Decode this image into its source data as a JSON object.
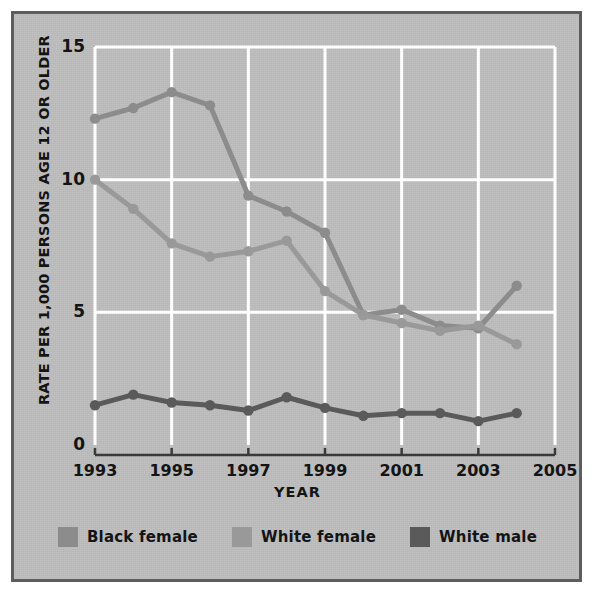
{
  "figure": {
    "background_color": "#bdbdbd",
    "border_color": "#5d5d5d",
    "gridline_color": "#ffffff",
    "axis_color": "#3a3a3a"
  },
  "axes": {
    "ylabel": "RATE PER 1,000 PERSONS AGE 12 OR OLDER",
    "xlabel": "YEAR",
    "yticks": [
      "0",
      "5",
      "10",
      "15"
    ],
    "xticks": [
      "1993",
      "1995",
      "1997",
      "1999",
      "2001",
      "2003",
      "2005"
    ]
  },
  "legend": {
    "items": [
      {
        "label": "Black female",
        "color": "#8c8c8c"
      },
      {
        "label": "White female",
        "color": "#999999"
      },
      {
        "label": "White male",
        "color": "#5a5a5a"
      }
    ]
  },
  "chart_data": {
    "type": "line",
    "title": "",
    "subtitle": "",
    "xlabel": "YEAR",
    "ylabel": "RATE PER 1,000 PERSONS AGE 12 OR OLDER",
    "xlim": [
      1993,
      2005
    ],
    "ylim": [
      0,
      15
    ],
    "yticks": [
      0,
      5,
      10,
      15
    ],
    "xticks": [
      1993,
      1995,
      1997,
      1999,
      2001,
      2003,
      2005
    ],
    "grid": true,
    "legend_position": "bottom",
    "x": [
      1993,
      1994,
      1995,
      1996,
      1997,
      1998,
      1999,
      2000,
      2001,
      2002,
      2003,
      2004
    ],
    "series": [
      {
        "name": "Black female",
        "color": "#8c8c8c",
        "values": [
          12.3,
          12.7,
          13.3,
          12.8,
          9.4,
          8.8,
          8.0,
          4.9,
          5.1,
          4.5,
          4.4,
          6.0
        ]
      },
      {
        "name": "White female",
        "color": "#999999",
        "values": [
          10.0,
          8.9,
          7.6,
          7.1,
          7.3,
          7.7,
          5.8,
          4.9,
          4.6,
          4.3,
          4.5,
          3.8
        ]
      },
      {
        "name": "White male",
        "color": "#5a5a5a",
        "values": [
          1.5,
          1.9,
          1.6,
          1.5,
          1.3,
          1.8,
          1.4,
          1.1,
          1.2,
          1.2,
          0.9,
          1.2
        ]
      }
    ]
  }
}
